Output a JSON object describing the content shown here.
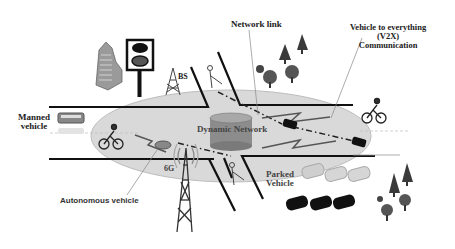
{
  "diagram": {
    "labels": {
      "network_link": "Network link",
      "v2x_line1": "Vehicle to everything",
      "v2x_line2": "(V2X)",
      "v2x_line3": "Communication",
      "bs": "BS",
      "manned_line1": "Manned",
      "manned_line2": "vehicle",
      "dynamic_network": "Dynamic Network",
      "six_g": "6G",
      "parked_line1": "Parked",
      "parked_line2": "Vehicle",
      "autonomous": "Autonomous vehicle"
    },
    "colors": {
      "ellipse_fill": "#d9d9d9",
      "ellipse_stroke": "#bdbdbd",
      "road": "#111111",
      "cylinder": "#8c8c8c",
      "tree_dark": "#3a3a3a",
      "text": "#1a1a1a"
    }
  }
}
